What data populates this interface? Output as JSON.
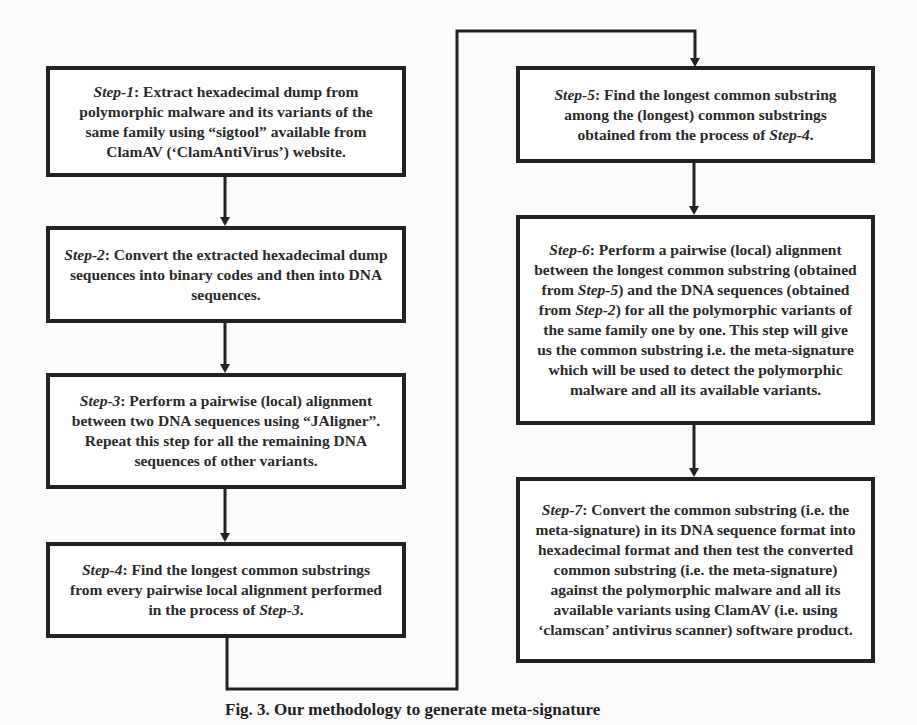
{
  "diagram": {
    "type": "flowchart",
    "colors": {
      "border": "#222222",
      "box_fill": "#ffffff",
      "text": "#2a2a2a",
      "background": "#fbfbfb"
    },
    "steps": [
      {
        "id": "step-1",
        "label": "Step-1",
        "parts": [
          ": Extract hexadecimal dump from polymorphic malware and its variants of the same family using “sigtool” available from ClamAV (‘ClamAntiVirus’) website."
        ]
      },
      {
        "id": "step-2",
        "label": "Step-2",
        "parts": [
          ": Convert the extracted hexadecimal dump sequences into binary codes and then into DNA sequences."
        ]
      },
      {
        "id": "step-3",
        "label": "Step-3",
        "parts": [
          ": Perform a pairwise (local) alignment between two DNA sequences using “JAligner”. Repeat this step for all the remaining DNA sequences of other variants."
        ]
      },
      {
        "id": "step-4",
        "label": "Step-4",
        "parts": [
          ": Find the longest common substrings from every pairwise local alignment performed in the process of ",
          "Step-3",
          "."
        ]
      },
      {
        "id": "step-5",
        "label": "Step-5",
        "parts": [
          ": Find the longest common substring among the (longest) common substrings obtained from the process of ",
          "Step-4",
          "."
        ]
      },
      {
        "id": "step-6",
        "label": "Step-6",
        "parts": [
          ": Perform a pairwise (local) alignment between the longest common substring (obtained from ",
          "Step-5",
          ") and the DNA sequences (obtained from ",
          "Step-2",
          ") for all the polymorphic variants of the same family one by one. This step will give us the common substring i.e. the meta-signature which will be used to detect the polymorphic malware and all its available variants."
        ]
      },
      {
        "id": "step-7",
        "label": "Step-7",
        "parts": [
          ": Convert the common substring (i.e. the meta-signature) in its DNA sequence format into hexadecimal format and then test the converted common substring (i.e. the meta-signature) against the polymorphic malware and all its available variants using ClamAV (i.e. using ‘clamscan’ antivirus scanner) software product."
        ]
      }
    ],
    "edges": [
      {
        "from": "step-1",
        "to": "step-2"
      },
      {
        "from": "step-2",
        "to": "step-3"
      },
      {
        "from": "step-3",
        "to": "step-4"
      },
      {
        "from": "step-4",
        "to": "step-5"
      },
      {
        "from": "step-5",
        "to": "step-6"
      },
      {
        "from": "step-6",
        "to": "step-7"
      }
    ],
    "caption": {
      "figure_number": "Fig. 3.",
      "text": "Our methodology to generate meta-signature"
    }
  }
}
